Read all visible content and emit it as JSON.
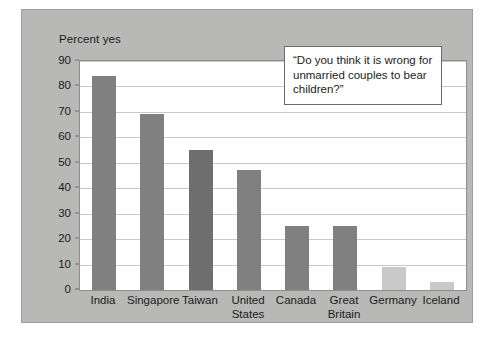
{
  "colors": {
    "panel_background": "#b8b8b6",
    "plot_background": "#ffffff",
    "bar_default": "#808080",
    "bar_dark": "#6e6e6e",
    "bar_light": "#c9c9c9",
    "gridline": "#c9c9c9",
    "text": "#1b1b1b",
    "callout_border": "#6b6b6b"
  },
  "chart_data": {
    "type": "bar",
    "title": "",
    "xlabel": "",
    "ylabel": "Percent yes",
    "ylim": [
      0,
      90
    ],
    "yticks": [
      0,
      10,
      20,
      30,
      40,
      50,
      60,
      70,
      80,
      90
    ],
    "grid": true,
    "legend": "none",
    "annotation": "“Do you think it is wrong for unmarried couples to bear children?”",
    "categories": [
      "India",
      "Singapore",
      "Taiwan",
      "United States",
      "Canada",
      "Great Britain",
      "Germany",
      "Iceland"
    ],
    "category_lines": [
      [
        "India"
      ],
      [
        "Singapore"
      ],
      [
        "Taiwan"
      ],
      [
        "United",
        "States"
      ],
      [
        "Canada"
      ],
      [
        "Great",
        "Britain"
      ],
      [
        "Germany"
      ],
      [
        "Iceland"
      ]
    ],
    "values": [
      84,
      69,
      55,
      47,
      25,
      25,
      9,
      3
    ],
    "bar_colors": [
      "#808080",
      "#808080",
      "#6e6e6e",
      "#808080",
      "#808080",
      "#808080",
      "#c9c9c9",
      "#c9c9c9"
    ]
  },
  "axis": {
    "y_title": "Percent yes"
  }
}
